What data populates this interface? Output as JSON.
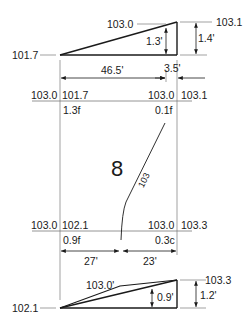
{
  "top_section": {
    "left_elev": "101.7",
    "mid_elev": "103.0",
    "right_elev": "103.1",
    "rise_inner": "1.3'",
    "rise_outer": "1.4'",
    "run_main": "46.5'",
    "run_short": "3.5'"
  },
  "plan": {
    "top_row": {
      "existing_left": "103.0",
      "proposed_left": "101.7",
      "existing_right": "103.0",
      "proposed_right": "103.1"
    },
    "top_cuts": {
      "left": "1.3f",
      "right": "0.1f"
    },
    "lot_number": "8",
    "contour_label": "103",
    "bottom_row": {
      "existing_left": "103.0",
      "proposed_left": "102.1",
      "existing_right": "103.0",
      "proposed_right": "103.3"
    },
    "bottom_cuts": {
      "left": "0.9f",
      "right": "0.3c"
    },
    "dim_left": "27'",
    "dim_right": "23'"
  },
  "bottom_section": {
    "left_elev": "102.1",
    "mid_elev": "103.0'",
    "right_elev": "103.3",
    "rise_inner": "0.9'",
    "rise_outer": "1.2'"
  },
  "colors": {
    "line": "#1a1a1a",
    "thin": "#7a7a7a",
    "background": "#ffffff"
  }
}
